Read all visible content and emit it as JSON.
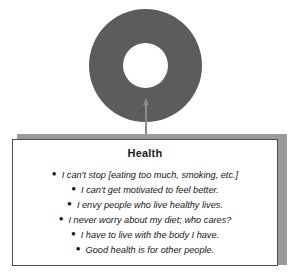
{
  "diagram": {
    "node": {
      "shape_name": "donut-ring",
      "fill_color": "#5c5c5c",
      "hole_color": "#ffffff"
    },
    "connector": {
      "shape_name": "up-arrow-connector",
      "color": "#8a8a8a"
    },
    "callout": {
      "title": "Health",
      "border_color": "#4d4d4d",
      "shadow_color": "#9a9a9a",
      "background_color": "#ffffff",
      "bullets": [
        {
          "text": "I can't stop [eating too much, smoking, etc.]"
        },
        {
          "text": "I can't get motivated to feel better."
        },
        {
          "text": "I envy people who live healthy lives."
        },
        {
          "text": "I never worry about my diet; who cares?"
        },
        {
          "text": "I have to live with the body I have."
        },
        {
          "text": "Good health is for other people."
        }
      ],
      "bullet_glyph": "●"
    }
  }
}
